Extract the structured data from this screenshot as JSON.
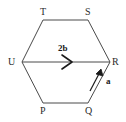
{
  "figure": {
    "shape": "regular hexagon",
    "stroke_color": "#4a4a4a",
    "text_color": "#2b2b2b",
    "background_color": "#ffffff"
  },
  "vertices": [
    {
      "id": "T",
      "label": "T",
      "position": "top-left",
      "x": 43,
      "y": 20
    },
    {
      "id": "S",
      "label": "S",
      "position": "top-right",
      "x": 88,
      "y": 20
    },
    {
      "id": "R",
      "label": "R",
      "position": "right",
      "x": 110,
      "y": 62
    },
    {
      "id": "Q",
      "label": "Q",
      "position": "bottom-right",
      "x": 88,
      "y": 103
    },
    {
      "id": "P",
      "label": "P",
      "position": "bottom-left",
      "x": 43,
      "y": 103
    },
    {
      "id": "U",
      "label": "U",
      "position": "left",
      "x": 22,
      "y": 62
    }
  ],
  "vectors": [
    {
      "id": "two-b",
      "label": "2b",
      "from": "U",
      "to": "R",
      "description": "horizontal vector across the hexagon from U to R",
      "arrowhead": "chevron"
    },
    {
      "id": "a",
      "label": "a",
      "from": "Q",
      "to": "R",
      "description": "vector along the lower-right edge from Q toward R",
      "arrowhead": "solid"
    }
  ]
}
